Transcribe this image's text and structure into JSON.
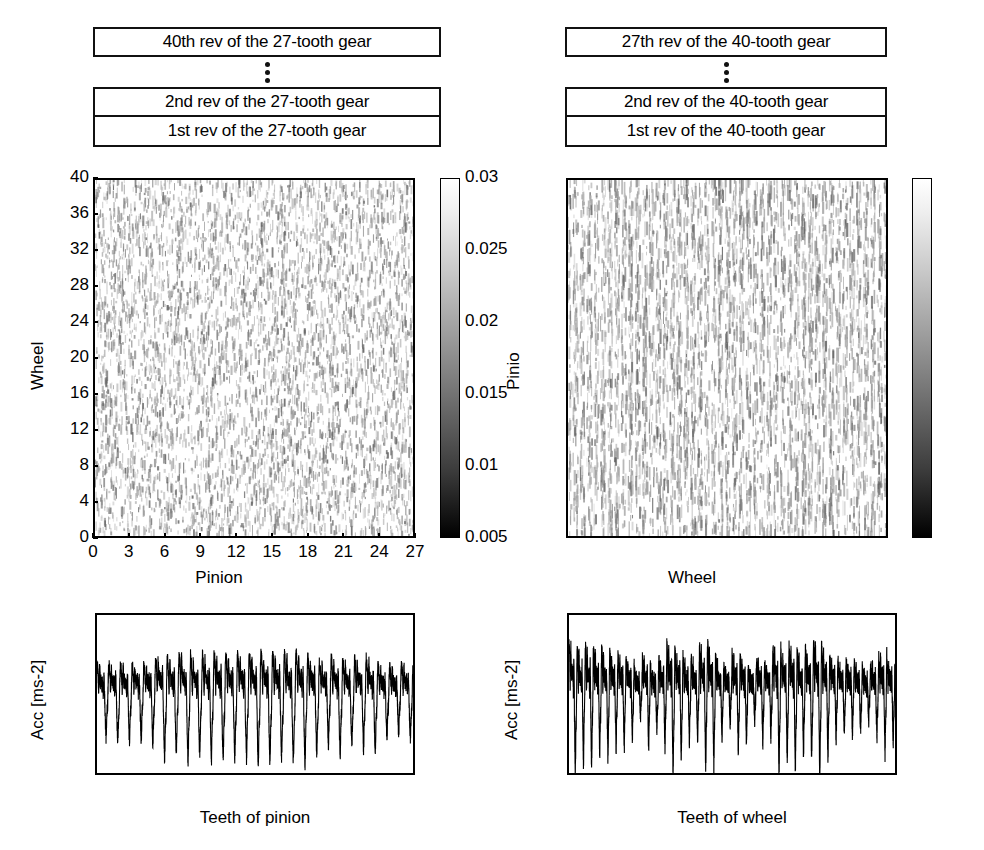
{
  "figure": {
    "width": 984,
    "height": 850,
    "background": "#ffffff",
    "ink": "#000000"
  },
  "left_column": {
    "stack": {
      "top_label": "40th rev of the 27-tooth gear",
      "ellipsis": "vertical-three-dots",
      "second_label": "2nd rev of the 27-tooth gear",
      "first_label": "1st rev of the 27-tooth gear"
    }
  },
  "right_column": {
    "stack": {
      "top_label": "27th rev of the 40-tooth gear",
      "ellipsis": "vertical-three-dots",
      "second_label": "2nd rev of the 40-tooth gear",
      "first_label": "1st rev of the 40-tooth gear"
    }
  },
  "chart_data": [
    {
      "id": "left-colormap",
      "type": "heatmap",
      "title": "",
      "xlabel": "Pinion",
      "ylabel": "Wheel",
      "xlim": [
        0,
        27
      ],
      "ylim": [
        0,
        40
      ],
      "xticks": [
        0,
        3,
        6,
        9,
        12,
        15,
        18,
        21,
        24,
        27
      ],
      "xticklabels": [
        "0",
        "3",
        "6",
        "9",
        "12",
        "15",
        "18",
        "21",
        "24",
        "27"
      ],
      "yticks": [
        0,
        4,
        8,
        12,
        16,
        20,
        24,
        28,
        32,
        36,
        40
      ],
      "yticklabels": [
        "0",
        "4",
        "8",
        "12",
        "16",
        "20",
        "24",
        "28",
        "32",
        "36",
        "40"
      ],
      "grid": false,
      "colormap": "gray",
      "colorbar": {
        "position": "right",
        "vmin": 0.005,
        "vmax": 0.03,
        "ticks": [
          0.005,
          0.01,
          0.015,
          0.02,
          0.025,
          0.03
        ],
        "ticklabels": [
          "0.005",
          "0.01",
          "0.015",
          "0.02",
          "0.025",
          "0.03"
        ],
        "low_color": "#000000",
        "high_color": "#ffffff"
      },
      "texture": "diagonal-streaks",
      "notes": "Residual-signal map: one row per wheel revolution, streak pattern drifts diagonally with pinion angle."
    },
    {
      "id": "right-colormap",
      "type": "heatmap",
      "title": "",
      "xlabel": "Wheel",
      "ylabel": "Pinio",
      "xlim": [
        0,
        40
      ],
      "ylim": [
        0,
        27
      ],
      "xticks": [
        0,
        4,
        8,
        12,
        16,
        20,
        24,
        28,
        32,
        36,
        40
      ],
      "xticklabels": [
        "0",
        "4",
        "8",
        "12",
        "16",
        "20",
        "24",
        "28",
        "32",
        "36",
        "40"
      ],
      "yticks": [
        0,
        3,
        6,
        9,
        12,
        15,
        18,
        21,
        24,
        27
      ],
      "yticklabels": [
        "0",
        "3",
        "6",
        "9",
        "12",
        "15",
        "18",
        "21",
        "24",
        "27"
      ],
      "grid": false,
      "colormap": "gray",
      "colorbar": {
        "position": "right",
        "vmin": 0.005,
        "vmax": 0.025,
        "ticks": [
          0.005,
          0.01,
          0.015,
          0.02,
          0.025
        ],
        "ticklabels": [
          "0.005",
          "0.01",
          "0.015",
          "0.02",
          "0.025"
        ],
        "low_color": "#000000",
        "high_color": "#ffffff"
      },
      "texture": "vertical-streaks",
      "notes": "Residual-signal map: one row per pinion revolution, streaks stay vertically aligned with wheel angle."
    },
    {
      "id": "bottom-left-signal",
      "type": "line",
      "title": "",
      "xlabel": "Teeth of pinion",
      "ylabel": "Acc [ms-2]",
      "xlim": [
        0,
        27
      ],
      "ylim": [
        -0.1,
        0.1
      ],
      "xticks": [
        0,
        3,
        6,
        9,
        12,
        15,
        18,
        21,
        24,
        27
      ],
      "xticklabels": [
        "0",
        "3",
        "6",
        "9",
        "12",
        "15",
        "18",
        "21",
        "24",
        "27"
      ],
      "yticks": [
        -0.1,
        -0.05,
        0,
        0.05,
        0.1
      ],
      "yticklabels": [
        "-0.1",
        "-0.05",
        "0",
        "0.05",
        "0.1"
      ],
      "grid": false,
      "line_color": "#000000",
      "series": [
        {
          "name": "pinion mesh acceleration",
          "tooth_count": 27,
          "peak_positive": 0.068,
          "peak_negative": -0.095,
          "envelope_max_near_tooth": 14,
          "envelope_min_near_tooth": 5,
          "description": "One dominant oscillation per pinion tooth with amplitude modulation peaking around teeth 12-20."
        }
      ]
    },
    {
      "id": "bottom-right-signal",
      "type": "line",
      "title": "",
      "xlabel": "Teeth of wheel",
      "ylabel": "Acc [ms-2]",
      "xlim": [
        0,
        40
      ],
      "ylim": [
        -0.12,
        0.1
      ],
      "xticks": [
        0,
        4,
        8,
        12,
        16,
        20,
        24,
        28,
        32,
        36,
        40
      ],
      "xticklabels": [
        "0",
        "4",
        "8",
        "12",
        "16",
        "20",
        "24",
        "28",
        "32",
        "36",
        "40"
      ],
      "yticks": [
        -0.1,
        -0.05,
        0,
        0.05,
        0.1
      ],
      "yticklabels": [
        "-0.1",
        "-0.05",
        "0",
        "0.05",
        "0.1"
      ],
      "grid": false,
      "line_color": "#000000",
      "series": [
        {
          "name": "wheel mesh acceleration",
          "tooth_count": 40,
          "peak_positive": 0.085,
          "peak_negative": -0.118,
          "description": "Dense irregular oscillation across all 40 wheel teeth with bursts reaching beyond -0.1."
        }
      ]
    }
  ]
}
